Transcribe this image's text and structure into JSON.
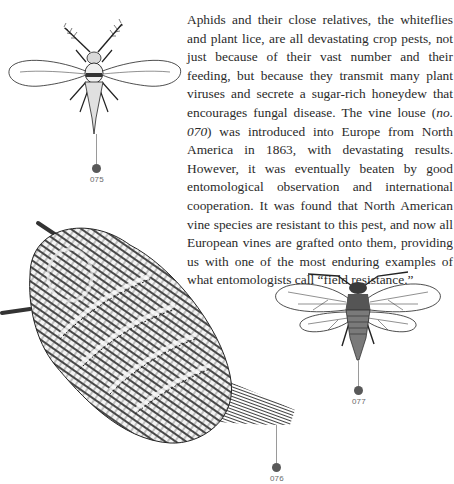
{
  "article": {
    "paragraph_before": "Aphids and their close relatives, the whiteflies and plant lice, are all devastating crop pests, not just because of their vast number and their feeding, but because they transmit many plant viruses and secrete a sugar-rich honeydew that encourages fungal disease. The vine louse (",
    "paragraph_ref": "no. 070",
    "paragraph_after": ") was introduced into Europe from North America in 1863, with devastating results. However, it was eventually beaten by good entomological observation and international cooperation. It was found that North American vine species are resistant to this pest, and now all European vines are grafted onto them, providing us with one of the most enduring examples of what entomologists call “field resistance.”"
  },
  "figures": [
    {
      "id": "fig-075",
      "label": "075",
      "subject": "whitefly-illustration"
    },
    {
      "id": "fig-076",
      "label": "076",
      "subject": "woolly-scale-insect-illustration"
    },
    {
      "id": "fig-077",
      "label": "077",
      "subject": "plant-louse-illustration"
    }
  ],
  "colors": {
    "text": "#2a2a2a",
    "marker_dot": "#595959",
    "leader_line": "#9a9a9a",
    "label": "#6a6a6a"
  }
}
